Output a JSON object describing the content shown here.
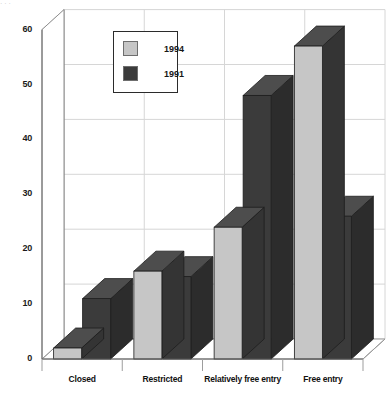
{
  "chart_data": {
    "type": "bar",
    "title": "",
    "subtitle": "",
    "xlabel": "",
    "ylabel": "",
    "categories": [
      "Closed",
      "Restricted",
      "Relatively free entry",
      "Free entry"
    ],
    "series": [
      {
        "name": "1994",
        "values": [
          2,
          16,
          24,
          57
        ],
        "color": "#c6c6c6"
      },
      {
        "name": "1991",
        "values": [
          11,
          15,
          48,
          26
        ],
        "color": "#3b3b3b"
      }
    ],
    "ylim": [
      0,
      60
    ],
    "yticks": [
      0,
      10,
      20,
      30,
      40,
      50,
      60
    ],
    "ytick_labels": [
      "0",
      "10",
      "20",
      "30",
      "40",
      "50",
      "60"
    ],
    "grid": true,
    "grid_axis": "y",
    "legend_position": "upper center",
    "style": "3d-grouped-bar",
    "annotations": []
  },
  "legend": {
    "entries": [
      {
        "label": "1994",
        "swatch_color": "#c6c6c6"
      },
      {
        "label": "1991",
        "swatch_color": "#3b3b3b"
      }
    ]
  },
  "axes": {
    "y_tick_labels": [
      "60",
      "50",
      "40",
      "30",
      "20",
      "10",
      "0"
    ],
    "x_tick_labels": [
      "Closed",
      "Restricted",
      "Relatively free entry",
      "Free entry"
    ]
  },
  "colors": {
    "series_1994": "#c6c6c6",
    "series_1991": "#3b3b3b",
    "series_1994_top": "#4a4a4a",
    "series_1994_side": "#343434",
    "series_1991_top": "#4a4a4a",
    "series_1991_side": "#2e2e2e",
    "grid": "#d6d6d6",
    "axis": "#8a8a8a",
    "text": "#141414",
    "background": "#ffffff"
  },
  "artifact": {
    "top_cut_text": "· · ·"
  }
}
